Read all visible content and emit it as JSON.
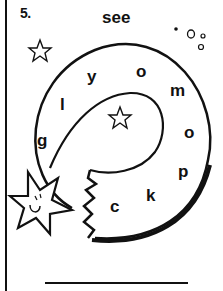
{
  "worksheet": {
    "item_number": "5.",
    "target_word": "see",
    "maze_letters": [
      "g",
      "l",
      "y",
      "o",
      "m",
      "o",
      "p",
      "k",
      "c"
    ],
    "answer_line_value": "",
    "colors": {
      "ink": "#111111",
      "paper": "#ffffff"
    }
  }
}
